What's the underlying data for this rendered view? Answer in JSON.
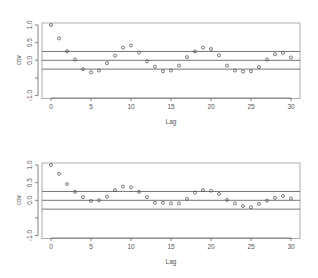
{
  "chart_data": [
    {
      "type": "scatter",
      "title": "",
      "xlabel": "Lag",
      "ylabel": "cov",
      "xlim": [
        0,
        30
      ],
      "ylim": [
        -1.0,
        1.0
      ],
      "xticks": [
        "0",
        "5",
        "10",
        "15",
        "20",
        "25",
        "30"
      ],
      "yticks": [
        "1.0",
        "0.5",
        "0.0",
        "",
        "-1.0"
      ],
      "ytick_values": [
        1.0,
        0.5,
        0.0,
        -0.5,
        -1.0
      ],
      "reference_lines": [
        0.25,
        0.0,
        -0.25
      ],
      "grid": false,
      "x": [
        0,
        1,
        2,
        3,
        4,
        5,
        6,
        7,
        8,
        9,
        10,
        11,
        12,
        13,
        14,
        15,
        16,
        17,
        18,
        19,
        20,
        21,
        22,
        23,
        24,
        25,
        26,
        27,
        28,
        29,
        30
      ],
      "values": [
        1.0,
        0.62,
        0.26,
        0.02,
        -0.25,
        -0.34,
        -0.29,
        -0.08,
        0.13,
        0.36,
        0.42,
        0.22,
        -0.03,
        -0.18,
        -0.31,
        -0.29,
        -0.15,
        0.09,
        0.25,
        0.36,
        0.32,
        0.14,
        -0.15,
        -0.29,
        -0.32,
        -0.31,
        -0.19,
        0.02,
        0.17,
        0.21,
        0.08
      ]
    },
    {
      "type": "scatter",
      "title": "",
      "xlabel": "Lag",
      "ylabel": "cov",
      "xlim": [
        0,
        30
      ],
      "ylim": [
        -1.0,
        1.0
      ],
      "xticks": [
        "0",
        "5",
        "10",
        "15",
        "20",
        "25",
        "30"
      ],
      "yticks": [
        "1.0",
        "0.5",
        "0.0",
        "",
        "-1.0"
      ],
      "ytick_values": [
        1.0,
        0.5,
        0.0,
        -0.5,
        -1.0
      ],
      "reference_lines": [
        0.25,
        0.0,
        -0.25
      ],
      "grid": false,
      "x": [
        0,
        1,
        2,
        3,
        4,
        5,
        6,
        7,
        8,
        9,
        10,
        11,
        12,
        13,
        14,
        15,
        16,
        17,
        18,
        19,
        20,
        21,
        22,
        23,
        24,
        25,
        26,
        27,
        28,
        29,
        30
      ],
      "values": [
        1.0,
        0.75,
        0.46,
        0.24,
        0.09,
        -0.02,
        0.0,
        0.1,
        0.29,
        0.39,
        0.37,
        0.24,
        0.09,
        -0.07,
        -0.07,
        -0.09,
        -0.09,
        0.04,
        0.22,
        0.29,
        0.27,
        0.18,
        0.01,
        -0.09,
        -0.16,
        -0.2,
        -0.1,
        -0.01,
        0.07,
        0.12,
        0.05
      ]
    }
  ]
}
